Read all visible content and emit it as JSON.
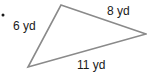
{
  "diagram": {
    "type": "triangle",
    "bullet": "•",
    "stroke_color": "#8a8a8a",
    "text_color": "#1a1a1a",
    "vertices": {
      "top": [
        61,
        5
      ],
      "right": [
        146,
        34
      ],
      "bottom_left": [
        28,
        67
      ]
    },
    "sides": [
      {
        "id": "left",
        "label": "6 yd",
        "length": 6,
        "unit": "yd"
      },
      {
        "id": "top",
        "label": "8 yd",
        "length": 8,
        "unit": "yd"
      },
      {
        "id": "bottom",
        "label": "11 yd",
        "length": 11,
        "unit": "yd"
      }
    ]
  }
}
